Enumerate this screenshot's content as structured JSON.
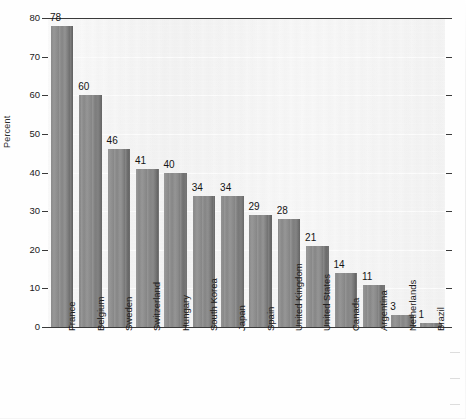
{
  "chart_data": {
    "type": "bar",
    "title": "",
    "xlabel": "",
    "ylabel": "Percent",
    "ylim": [
      0,
      80
    ],
    "yticks": [
      0,
      10,
      20,
      30,
      40,
      50,
      60,
      70,
      80
    ],
    "grid": true,
    "legend": "none",
    "orientation": "vertical",
    "value_labels": true,
    "categories": [
      "France",
      "Belgium",
      "Sweden",
      "Switzerland",
      "Hungary",
      "South Korea",
      "Japan",
      "Spain",
      "United Kingdom",
      "United States",
      "Canada",
      "Argentina",
      "Netherlands",
      "Brazil"
    ],
    "values": [
      78,
      60,
      46,
      41,
      40,
      34,
      34,
      29,
      28,
      21,
      14,
      11,
      3,
      1
    ]
  },
  "style": {
    "bar_color": "#818181",
    "bar_shadow_color": "#5f5f5f",
    "plot_background": "#f1f1f1",
    "axis_color": "#3a3a3a",
    "gridline_color": "#fcfcfc",
    "text_color": "#1a1a1a"
  }
}
